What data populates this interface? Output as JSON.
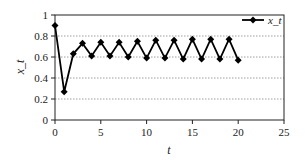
{
  "chart_data": {
    "type": "line",
    "title": "",
    "xlabel": "t",
    "ylabel": "x_t",
    "xlim": [
      0,
      25
    ],
    "ylim": [
      0,
      1
    ],
    "xticks": [
      0,
      5,
      10,
      15,
      20,
      25
    ],
    "yticks": [
      0,
      0.2,
      0.4,
      0.6,
      0.8,
      1
    ],
    "ytick_labels": [
      "0",
      "0.2",
      "0.4",
      "0.6",
      "0.8",
      "1"
    ],
    "grid": {
      "horizontal": true,
      "vertical": false,
      "style": "dotted"
    },
    "legend": {
      "position": "top-right",
      "entries": [
        "x_t"
      ]
    },
    "series": [
      {
        "name": "x_t",
        "marker": "diamond",
        "color": "#000000",
        "x": [
          0,
          1,
          2,
          3,
          4,
          5,
          6,
          7,
          8,
          9,
          10,
          11,
          12,
          13,
          14,
          15,
          16,
          17,
          18,
          19,
          20
        ],
        "values": [
          0.9,
          0.27,
          0.63,
          0.73,
          0.61,
          0.74,
          0.61,
          0.74,
          0.6,
          0.75,
          0.59,
          0.76,
          0.59,
          0.76,
          0.58,
          0.77,
          0.58,
          0.77,
          0.58,
          0.77,
          0.57
        ]
      }
    ]
  }
}
